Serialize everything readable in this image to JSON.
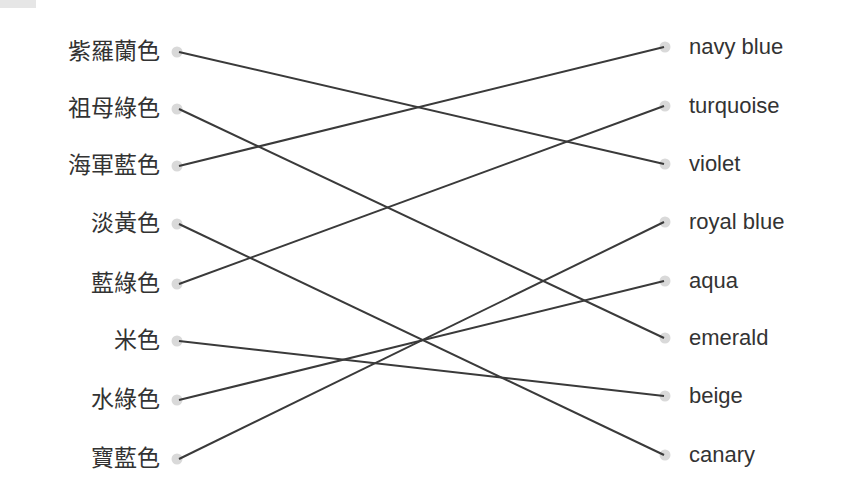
{
  "exercise": {
    "type": "matching",
    "left_items": [
      {
        "label": "紫羅蘭色",
        "y": 52
      },
      {
        "label": "祖母綠色",
        "y": 109
      },
      {
        "label": "海軍藍色",
        "y": 166
      },
      {
        "label": "淡黃色",
        "y": 224
      },
      {
        "label": "藍綠色",
        "y": 284
      },
      {
        "label": "米色",
        "y": 341
      },
      {
        "label": "水綠色",
        "y": 400
      },
      {
        "label": "寶藍色",
        "y": 459
      }
    ],
    "right_items": [
      {
        "label": "navy blue",
        "y": 47
      },
      {
        "label": "turquoise",
        "y": 106
      },
      {
        "label": "violet",
        "y": 164
      },
      {
        "label": "royal blue",
        "y": 222
      },
      {
        "label": "aqua",
        "y": 281
      },
      {
        "label": "emerald",
        "y": 338
      },
      {
        "label": "beige",
        "y": 396
      },
      {
        "label": "canary",
        "y": 455
      }
    ],
    "connections": [
      {
        "left": 0,
        "right": 2
      },
      {
        "left": 1,
        "right": 5
      },
      {
        "left": 2,
        "right": 0
      },
      {
        "left": 3,
        "right": 7
      },
      {
        "left": 4,
        "right": 1
      },
      {
        "left": 5,
        "right": 6
      },
      {
        "left": 6,
        "right": 4
      },
      {
        "left": 7,
        "right": 3
      }
    ]
  },
  "colors": {
    "text": "#333333",
    "line": "#3a3a3a",
    "dot": "#d9d9d9",
    "background": "#ffffff"
  }
}
